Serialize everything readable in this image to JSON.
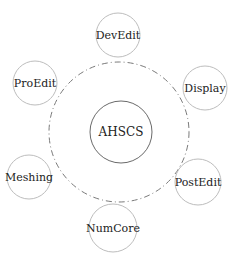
{
  "diagram": {
    "type": "hub-and-spoke",
    "center": {
      "label": "AHSCS",
      "cx": 121,
      "cy": 132,
      "r": 31,
      "stroke": "#6a6a6a"
    },
    "orbit": {
      "cx": 119,
      "cy": 132,
      "r": 70,
      "stroke": "#7a7a7a",
      "style": "dash-dot"
    },
    "satellites": [
      {
        "label": "DevEdit",
        "cx": 118,
        "cy": 35,
        "r": 22
      },
      {
        "label": "Display",
        "cx": 205,
        "cy": 88,
        "r": 22
      },
      {
        "label": "PostEdit",
        "cx": 198,
        "cy": 182,
        "r": 23
      },
      {
        "label": "NumCore",
        "cx": 113,
        "cy": 228,
        "r": 24
      },
      {
        "label": "Meshing",
        "cx": 29,
        "cy": 177,
        "r": 22
      },
      {
        "label": "ProEdit",
        "cx": 35,
        "cy": 83,
        "r": 22
      }
    ],
    "satellite_stroke": "#bdbdbd"
  }
}
